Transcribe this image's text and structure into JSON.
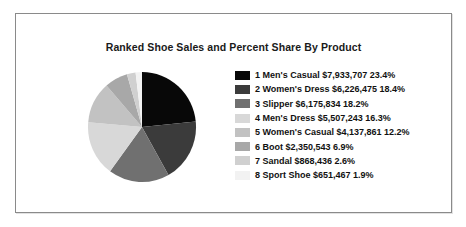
{
  "chart": {
    "title": "Ranked Shoe Sales and Percent Share By Product"
  },
  "legend": {
    "items": [
      {
        "label": "1 Men's Casual $7,933,707 23.4%",
        "color": "#080808"
      },
      {
        "label": "2 Women's Dress $6,226,475 18.4%",
        "color": "#3b3b3b"
      },
      {
        "label": "3 Slipper $6,175,834 18.2%",
        "color": "#707070"
      },
      {
        "label": "4 Men's Dress $5,507,243 16.3%",
        "color": "#d8d8d8"
      },
      {
        "label": "5 Women's Casual $4,137,861 12.2%",
        "color": "#c2c2c2"
      },
      {
        "label": "6 Boot $2,350,543 6.9%",
        "color": "#a8a8a8"
      },
      {
        "label": "7 Sandal $868,436 2.6%",
        "color": "#d0d0d0"
      },
      {
        "label": "8 Sport Shoe $651,467 1.9%",
        "color": "#f2f2f2"
      }
    ]
  },
  "chart_data": {
    "type": "pie",
    "title": "Ranked Shoe Sales and Percent Share By Product",
    "xlabel": "",
    "ylabel": "",
    "legend_position": "right",
    "grid": false,
    "start_angle_deg": 0,
    "direction": "clockwise",
    "categories": [
      "Men's Casual",
      "Women's Dress",
      "Slipper",
      "Men's Dress",
      "Women's Casual",
      "Boot",
      "Sandal",
      "Sport Shoe"
    ],
    "values": [
      7933707,
      6226475,
      6175834,
      5507243,
      4137861,
      2350543,
      868436,
      651467
    ],
    "percents": [
      23.4,
      18.4,
      18.2,
      16.3,
      12.2,
      6.9,
      2.6,
      1.9
    ],
    "value_labels": [
      "$7,933,707",
      "$6,226,475",
      "$6,175,834",
      "$5,507,243",
      "$4,137,861",
      "$2,350,543",
      "$868,436",
      "$651,467"
    ],
    "percent_labels": [
      "23.4%",
      "18.4%",
      "18.2%",
      "16.3%",
      "12.2%",
      "6.9%",
      "2.6%",
      "1.9%"
    ],
    "ranks": [
      1,
      2,
      3,
      4,
      5,
      6,
      7,
      8
    ],
    "colors": [
      "#080808",
      "#3b3b3b",
      "#707070",
      "#d8d8d8",
      "#c2c2c2",
      "#a8a8a8",
      "#d0d0d0",
      "#f2f2f2"
    ]
  }
}
